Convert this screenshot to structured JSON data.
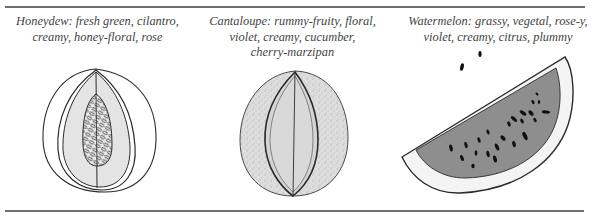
{
  "figure": {
    "items": [
      {
        "name": "Honeydew",
        "caption_lines": [
          "Honeydew: fresh green, cilantro,",
          "creamy, honey-floral, rose"
        ],
        "illustration": "honeydew-halved-icon"
      },
      {
        "name": "Cantaloupe",
        "caption_lines": [
          "Cantaloupe: rummy-fruity, floral,",
          "violet, creamy, cucumber,",
          "cherry-marzipan"
        ],
        "illustration": "cantaloupe-sliced-icon"
      },
      {
        "name": "Watermelon",
        "caption_lines": [
          "Watermelon: grassy, vegetal, rose-y,",
          "violet, creamy, citrus, plummy"
        ],
        "illustration": "watermelon-wedge-icon"
      }
    ],
    "colors": {
      "rule": "#6e6e6e",
      "ink": "#2a2a2a",
      "flesh_light": "#e6e6e6",
      "rind_texture": "#cfcfcf",
      "watermelon_flesh": "#8a8a8a"
    }
  }
}
